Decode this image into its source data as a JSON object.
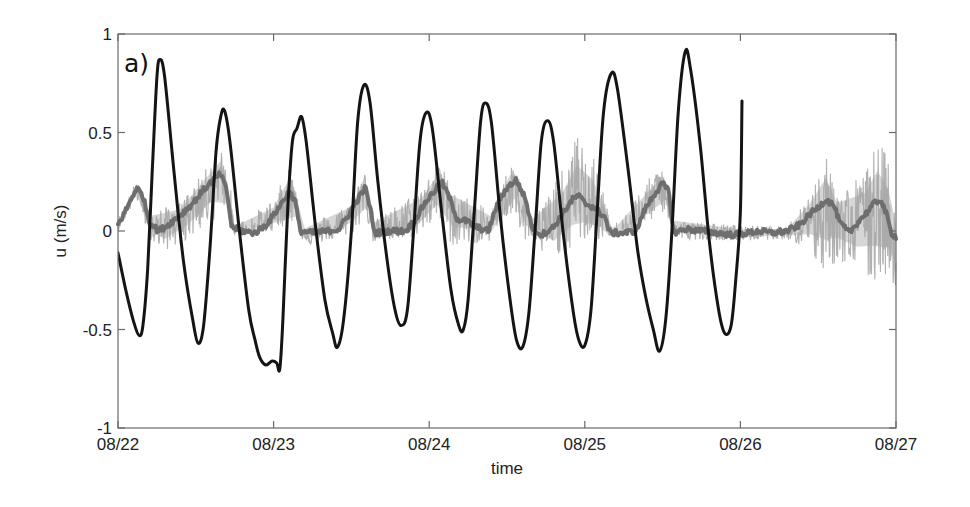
{
  "chart_data": {
    "type": "line",
    "panel_label": "a)",
    "title": "",
    "xlabel": "time",
    "ylabel": "u (m/s)",
    "xlim": [
      0,
      5
    ],
    "ylim": [
      -1,
      1
    ],
    "grid": false,
    "legend": null,
    "x_ticks": [
      {
        "value": 0,
        "label": "08/22"
      },
      {
        "value": 1,
        "label": "08/23"
      },
      {
        "value": 2,
        "label": "08/24"
      },
      {
        "value": 3,
        "label": "08/25"
      },
      {
        "value": 4,
        "label": "08/26"
      },
      {
        "value": 5,
        "label": "08/27"
      }
    ],
    "y_ticks": [
      {
        "value": 1,
        "label": "1"
      },
      {
        "value": 0.5,
        "label": "0.5"
      },
      {
        "value": 0,
        "label": "0"
      },
      {
        "value": -0.5,
        "label": "-0.5"
      },
      {
        "value": -1,
        "label": "-1"
      }
    ],
    "x_unit": "days since 08/22",
    "series": [
      {
        "name": "black-velocity",
        "color": "#141414",
        "width": 3,
        "points": [
          [
            0.0,
            -0.11
          ],
          [
            0.05,
            -0.3
          ],
          [
            0.1,
            -0.46
          ],
          [
            0.135,
            -0.53
          ],
          [
            0.16,
            -0.48
          ],
          [
            0.19,
            -0.2
          ],
          [
            0.22,
            0.3
          ],
          [
            0.25,
            0.78
          ],
          [
            0.27,
            0.87
          ],
          [
            0.3,
            0.78
          ],
          [
            0.36,
            0.3
          ],
          [
            0.42,
            -0.15
          ],
          [
            0.48,
            -0.45
          ],
          [
            0.515,
            -0.57
          ],
          [
            0.55,
            -0.48
          ],
          [
            0.59,
            -0.1
          ],
          [
            0.63,
            0.4
          ],
          [
            0.66,
            0.58
          ],
          [
            0.685,
            0.61
          ],
          [
            0.72,
            0.45
          ],
          [
            0.78,
            0.0
          ],
          [
            0.84,
            -0.4
          ],
          [
            0.88,
            -0.55
          ],
          [
            0.91,
            -0.64
          ],
          [
            0.95,
            -0.68
          ],
          [
            0.99,
            -0.66
          ],
          [
            1.02,
            -0.67
          ],
          [
            1.04,
            -0.7
          ],
          [
            1.06,
            -0.45
          ],
          [
            1.09,
            0.1
          ],
          [
            1.12,
            0.45
          ],
          [
            1.15,
            0.52
          ],
          [
            1.18,
            0.58
          ],
          [
            1.21,
            0.45
          ],
          [
            1.27,
            0.02
          ],
          [
            1.33,
            -0.35
          ],
          [
            1.38,
            -0.52
          ],
          [
            1.41,
            -0.59
          ],
          [
            1.45,
            -0.45
          ],
          [
            1.5,
            0.0
          ],
          [
            1.54,
            0.55
          ],
          [
            1.58,
            0.74
          ],
          [
            1.62,
            0.65
          ],
          [
            1.67,
            0.25
          ],
          [
            1.73,
            -0.15
          ],
          [
            1.78,
            -0.4
          ],
          [
            1.82,
            -0.48
          ],
          [
            1.86,
            -0.4
          ],
          [
            1.9,
            0.0
          ],
          [
            1.94,
            0.45
          ],
          [
            1.98,
            0.6
          ],
          [
            2.02,
            0.52
          ],
          [
            2.08,
            0.1
          ],
          [
            2.14,
            -0.3
          ],
          [
            2.19,
            -0.48
          ],
          [
            2.22,
            -0.5
          ],
          [
            2.25,
            -0.35
          ],
          [
            2.29,
            0.1
          ],
          [
            2.33,
            0.55
          ],
          [
            2.36,
            0.65
          ],
          [
            2.4,
            0.55
          ],
          [
            2.46,
            0.05
          ],
          [
            2.52,
            -0.35
          ],
          [
            2.56,
            -0.55
          ],
          [
            2.6,
            -0.59
          ],
          [
            2.64,
            -0.42
          ],
          [
            2.68,
            0.0
          ],
          [
            2.72,
            0.45
          ],
          [
            2.76,
            0.56
          ],
          [
            2.8,
            0.45
          ],
          [
            2.86,
            0.0
          ],
          [
            2.92,
            -0.38
          ],
          [
            2.96,
            -0.55
          ],
          [
            3.0,
            -0.58
          ],
          [
            3.04,
            -0.4
          ],
          [
            3.08,
            0.1
          ],
          [
            3.12,
            0.6
          ],
          [
            3.17,
            0.8
          ],
          [
            3.21,
            0.72
          ],
          [
            3.28,
            0.3
          ],
          [
            3.34,
            -0.1
          ],
          [
            3.39,
            -0.33
          ],
          [
            3.44,
            -0.5
          ],
          [
            3.48,
            -0.61
          ],
          [
            3.52,
            -0.45
          ],
          [
            3.56,
            0.0
          ],
          [
            3.6,
            0.6
          ],
          [
            3.645,
            0.91
          ],
          [
            3.68,
            0.82
          ],
          [
            3.74,
            0.45
          ],
          [
            3.8,
            -0.05
          ],
          [
            3.86,
            -0.4
          ],
          [
            3.9,
            -0.52
          ],
          [
            3.94,
            -0.48
          ],
          [
            3.97,
            -0.25
          ],
          [
            4.0,
            0.1
          ],
          [
            4.01,
            0.66
          ]
        ]
      }
    ],
    "gray_series": {
      "name": "gray-velocity",
      "noisy_color": "#a3a3a3",
      "smoothed_color": "#6e6e6e",
      "smoothed_points": [
        [
          0.0,
          0.03
        ],
        [
          0.06,
          0.12
        ],
        [
          0.12,
          0.22
        ],
        [
          0.16,
          0.18
        ],
        [
          0.2,
          0.05
        ],
        [
          0.26,
          0.0
        ],
        [
          0.32,
          0.03
        ],
        [
          0.4,
          0.08
        ],
        [
          0.48,
          0.14
        ],
        [
          0.54,
          0.2
        ],
        [
          0.6,
          0.25
        ],
        [
          0.66,
          0.29
        ],
        [
          0.7,
          0.2
        ],
        [
          0.73,
          0.02
        ],
        [
          0.8,
          0.0
        ],
        [
          0.88,
          -0.01
        ],
        [
          0.95,
          0.03
        ],
        [
          1.0,
          0.08
        ],
        [
          1.05,
          0.14
        ],
        [
          1.1,
          0.2
        ],
        [
          1.14,
          0.15
        ],
        [
          1.17,
          0.0
        ],
        [
          1.25,
          -0.01
        ],
        [
          1.35,
          0.0
        ],
        [
          1.42,
          0.01
        ],
        [
          1.48,
          0.08
        ],
        [
          1.54,
          0.16
        ],
        [
          1.59,
          0.22
        ],
        [
          1.62,
          0.12
        ],
        [
          1.65,
          -0.01
        ],
        [
          1.75,
          0.0
        ],
        [
          1.85,
          0.0
        ],
        [
          1.92,
          0.07
        ],
        [
          1.97,
          0.14
        ],
        [
          2.03,
          0.2
        ],
        [
          2.08,
          0.25
        ],
        [
          2.13,
          0.17
        ],
        [
          2.18,
          0.06
        ],
        [
          2.24,
          0.05
        ],
        [
          2.3,
          0.02
        ],
        [
          2.38,
          0.0
        ],
        [
          2.44,
          0.14
        ],
        [
          2.5,
          0.22
        ],
        [
          2.56,
          0.26
        ],
        [
          2.62,
          0.16
        ],
        [
          2.66,
          0.02
        ],
        [
          2.72,
          -0.02
        ],
        [
          2.8,
          0.02
        ],
        [
          2.86,
          0.09
        ],
        [
          2.92,
          0.16
        ],
        [
          2.96,
          0.18
        ],
        [
          3.0,
          0.14
        ],
        [
          3.06,
          0.12
        ],
        [
          3.13,
          0.07
        ],
        [
          3.16,
          -0.01
        ],
        [
          3.25,
          -0.01
        ],
        [
          3.33,
          0.0
        ],
        [
          3.38,
          0.1
        ],
        [
          3.44,
          0.18
        ],
        [
          3.5,
          0.24
        ],
        [
          3.54,
          0.2
        ],
        [
          3.57,
          -0.01
        ],
        [
          3.65,
          0.01
        ],
        [
          3.75,
          0.0
        ],
        [
          3.85,
          -0.01
        ],
        [
          3.95,
          -0.02
        ],
        [
          4.05,
          -0.01
        ],
        [
          4.12,
          0.0
        ],
        [
          4.2,
          -0.01
        ],
        [
          4.3,
          0.0
        ],
        [
          4.38,
          0.03
        ],
        [
          4.44,
          0.08
        ],
        [
          4.5,
          0.12
        ],
        [
          4.55,
          0.16
        ],
        [
          4.6,
          0.13
        ],
        [
          4.64,
          0.04
        ],
        [
          4.7,
          -0.01
        ],
        [
          4.76,
          0.05
        ],
        [
          4.82,
          0.1
        ],
        [
          4.86,
          0.14
        ],
        [
          4.9,
          0.16
        ],
        [
          4.94,
          0.08
        ],
        [
          4.97,
          -0.01
        ],
        [
          5.0,
          -0.03
        ]
      ],
      "noise_envelope_upper": [
        [
          0.0,
          0.06
        ],
        [
          0.12,
          0.26
        ],
        [
          0.2,
          0.1
        ],
        [
          0.4,
          0.14
        ],
        [
          0.55,
          0.3
        ],
        [
          0.66,
          0.42
        ],
        [
          0.72,
          0.25
        ],
        [
          0.75,
          0.03
        ],
        [
          1.0,
          0.16
        ],
        [
          1.1,
          0.33
        ],
        [
          1.15,
          0.22
        ],
        [
          1.2,
          0.03
        ],
        [
          1.5,
          0.14
        ],
        [
          1.58,
          0.32
        ],
        [
          1.64,
          0.05
        ],
        [
          1.95,
          0.22
        ],
        [
          2.07,
          0.36
        ],
        [
          2.14,
          0.22
        ],
        [
          2.4,
          0.1
        ],
        [
          2.52,
          0.34
        ],
        [
          2.58,
          0.3
        ],
        [
          2.65,
          0.05
        ],
        [
          2.85,
          0.3
        ],
        [
          2.95,
          0.49
        ],
        [
          3.05,
          0.4
        ],
        [
          3.13,
          0.16
        ],
        [
          3.18,
          0.02
        ],
        [
          3.4,
          0.26
        ],
        [
          3.5,
          0.32
        ],
        [
          3.56,
          0.05
        ],
        [
          4.0,
          0.03
        ],
        [
          4.3,
          0.02
        ],
        [
          4.45,
          0.2
        ],
        [
          4.55,
          0.38
        ],
        [
          4.62,
          0.2
        ],
        [
          4.8,
          0.3
        ],
        [
          4.88,
          0.46
        ],
        [
          4.95,
          0.38
        ],
        [
          5.0,
          0.1
        ]
      ],
      "noise_envelope_lower": [
        [
          0.0,
          0.0
        ],
        [
          0.12,
          0.16
        ],
        [
          0.2,
          -0.04
        ],
        [
          0.3,
          -0.1
        ],
        [
          0.45,
          -0.05
        ],
        [
          0.6,
          0.05
        ],
        [
          0.7,
          0.08
        ],
        [
          0.75,
          -0.02
        ],
        [
          1.0,
          0.0
        ],
        [
          1.15,
          0.05
        ],
        [
          1.2,
          -0.08
        ],
        [
          1.5,
          -0.02
        ],
        [
          1.6,
          0.06
        ],
        [
          1.64,
          -0.06
        ],
        [
          1.9,
          -0.03
        ],
        [
          2.05,
          0.05
        ],
        [
          2.15,
          -0.08
        ],
        [
          2.4,
          -0.05
        ],
        [
          2.55,
          0.08
        ],
        [
          2.62,
          -0.1
        ],
        [
          2.8,
          -0.12
        ],
        [
          2.92,
          -0.1
        ],
        [
          3.0,
          -0.05
        ],
        [
          3.1,
          -0.05
        ],
        [
          3.16,
          -0.04
        ],
        [
          3.4,
          0.04
        ],
        [
          3.52,
          0.1
        ],
        [
          3.56,
          -0.04
        ],
        [
          4.0,
          -0.05
        ],
        [
          4.3,
          -0.04
        ],
        [
          4.45,
          -0.12
        ],
        [
          4.55,
          -0.25
        ],
        [
          4.62,
          -0.15
        ],
        [
          4.75,
          -0.2
        ],
        [
          4.85,
          -0.28
        ],
        [
          4.95,
          -0.22
        ],
        [
          5.0,
          -0.3
        ]
      ]
    }
  }
}
